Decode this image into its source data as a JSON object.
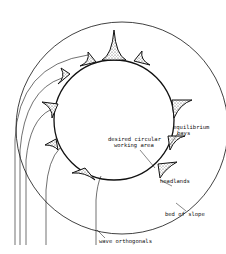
{
  "diagram": {
    "labels": {
      "desired_line1": "desired circular",
      "desired_line2": "working area",
      "equilibrium_line1": "equilibrium",
      "equilibrium_line2": "bays",
      "headlands": "headlands",
      "bed_of_slope": "bed of slope",
      "wave_orthogonals": "wave orthogonals"
    },
    "colors": {
      "line": "#111111",
      "fill": "#bbbbbb",
      "background": "#ffffff"
    }
  }
}
